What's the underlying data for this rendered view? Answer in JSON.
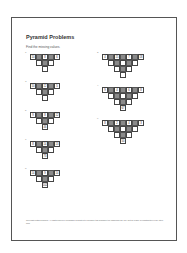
{
  "document": {
    "title": "Pyramid Problems",
    "instruction": "Find the missing values.",
    "footer": "Copyright Maths Resource. All rights reserved. Permission is granted to reproduce this worksheet for classroom use only. Not for resale or redistribution in any other form."
  },
  "pyramids": [
    {
      "number": "1",
      "base": [
        "10",
        "8",
        "6"
      ],
      "answer": ""
    },
    {
      "number": "2",
      "base": [
        "4",
        "15",
        "7",
        "18"
      ],
      "answer": ""
    },
    {
      "number": "3",
      "base": [
        "10",
        "12",
        "5"
      ],
      "answer": ""
    },
    {
      "number": "4",
      "base": [
        "9",
        "4",
        "6",
        "8"
      ],
      "answer": "67"
    },
    {
      "number": "5",
      "base": [
        "9",
        "8",
        "12"
      ],
      "answer": "46"
    },
    {
      "number": "6",
      "base": [
        "8",
        "2",
        "4",
        "3"
      ],
      "answer": "50"
    },
    {
      "number": "7",
      "base": [
        "8",
        "14",
        "13"
      ],
      "answer": "73"
    },
    {
      "number": "8",
      "base": [
        "14",
        "9",
        "14"
      ],
      "answer": "102"
    }
  ]
}
